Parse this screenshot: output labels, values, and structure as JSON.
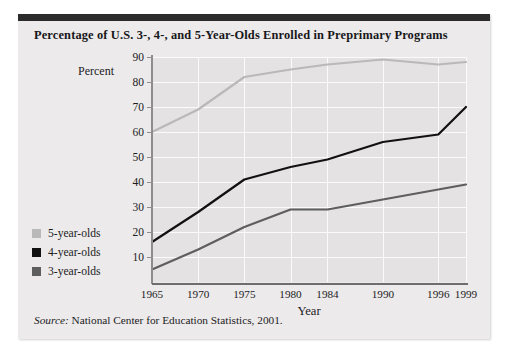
{
  "figure": {
    "title": "Percentage of U.S. 3-, 4-, and 5-Year-Olds Enrolled in Preprimary Programs",
    "source_prefix": "Source:",
    "source_text": "National Center for Education Statistics, 2001."
  },
  "legend": {
    "items": [
      {
        "label": "5-year-olds",
        "color": "#b9b9b9"
      },
      {
        "label": "4-year-olds",
        "color": "#111111"
      },
      {
        "label": "3-year-olds",
        "color": "#5e5e5e"
      }
    ]
  },
  "chart_data": {
    "type": "line",
    "title": "Percentage of U.S. 3-, 4-, and 5-Year-Olds Enrolled in Preprimary Programs",
    "xlabel": "Year",
    "ylabel": "Percent",
    "x": [
      1965,
      1970,
      1975,
      1980,
      1984,
      1990,
      1996,
      1999
    ],
    "xtick_labels": [
      "1965",
      "1970",
      "1975",
      "1980",
      "1984",
      "1990",
      "1996",
      "1999"
    ],
    "ytick_labels": [
      "90",
      "80",
      "70",
      "60",
      "50",
      "40",
      "30",
      "20",
      "10"
    ],
    "yticks": [
      90,
      80,
      70,
      60,
      50,
      40,
      30,
      20,
      10
    ],
    "ylim": [
      0,
      90
    ],
    "xlim": [
      1965,
      1999
    ],
    "grid": true,
    "legend_position": "left-outside",
    "series": [
      {
        "name": "5-year-olds",
        "color": "#b9b9b9",
        "values": [
          60,
          69,
          82,
          85,
          87,
          89,
          87,
          88
        ]
      },
      {
        "name": "4-year-olds",
        "color": "#111111",
        "values": [
          16,
          28,
          41,
          46,
          49,
          56,
          59,
          70
        ]
      },
      {
        "name": "3-year-olds",
        "color": "#5e5e5e",
        "values": [
          5,
          13,
          22,
          29,
          29,
          33,
          37,
          39
        ]
      }
    ]
  }
}
